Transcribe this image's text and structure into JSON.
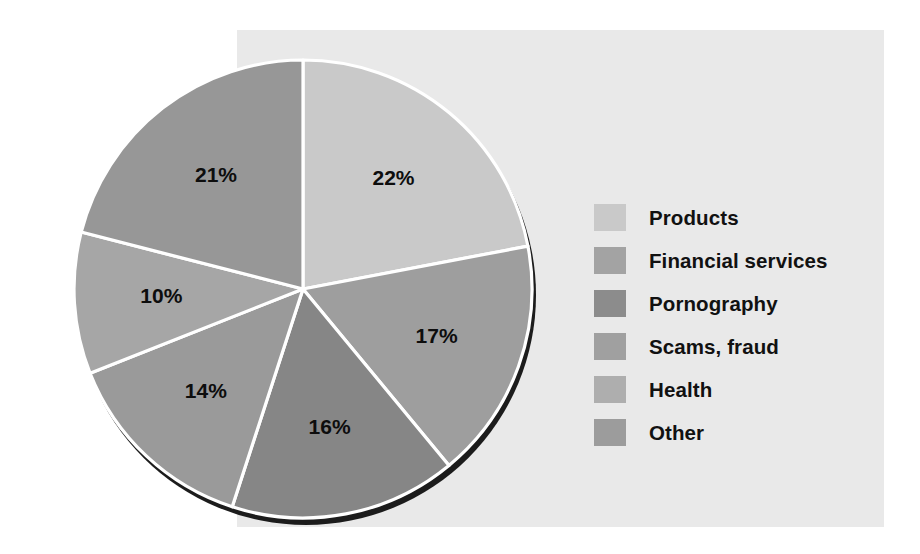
{
  "figure": {
    "background_color": "#ffffff",
    "panel_color": "#e9e9e9",
    "divider_color": "#ffffff",
    "shadow_color": "#1c1c1c",
    "label_color": "#0d0d0d"
  },
  "chart_data": {
    "type": "pie",
    "title": "",
    "subtitle": "",
    "xlabel": "",
    "ylabel": "",
    "grid": false,
    "legend_position": "right",
    "start_angle_deg": 0,
    "direction": "clockwise",
    "units": "percent",
    "total": 100,
    "categories": [
      "Products",
      "Financial services",
      "Pornography",
      "Scams, fraud",
      "Health",
      "Other"
    ],
    "values": [
      22,
      17,
      16,
      14,
      10,
      21
    ],
    "data_labels": [
      "22%",
      "17%",
      "16%",
      "14%",
      "10%",
      "21%"
    ],
    "colors": [
      "#c9c9c9",
      "#9e9e9e",
      "#868686",
      "#9a9a9a",
      "#a6a6a6",
      "#979797"
    ],
    "slices": [
      {
        "label": "Products",
        "value": 22,
        "data_label": "22%",
        "color": "#c9c9c9",
        "swatch_color": "#c9c9c9"
      },
      {
        "label": "Financial services",
        "value": 17,
        "data_label": "17%",
        "color": "#9e9e9e",
        "swatch_color": "#a3a3a3"
      },
      {
        "label": "Pornography",
        "value": 16,
        "data_label": "16%",
        "color": "#868686",
        "swatch_color": "#8c8c8c"
      },
      {
        "label": "Scams, fraud",
        "value": 14,
        "data_label": "14%",
        "color": "#9a9a9a",
        "swatch_color": "#a0a0a0"
      },
      {
        "label": "Health",
        "value": 10,
        "data_label": "10%",
        "color": "#a6a6a6",
        "swatch_color": "#aeaeae"
      },
      {
        "label": "Other",
        "value": 21,
        "data_label": "21%",
        "color": "#979797",
        "swatch_color": "#9c9c9c"
      }
    ]
  },
  "legend": {
    "items": [
      {
        "label": "Products"
      },
      {
        "label": "Financial services"
      },
      {
        "label": "Pornography"
      },
      {
        "label": "Scams, fraud"
      },
      {
        "label": "Health"
      },
      {
        "label": "Other"
      }
    ]
  }
}
